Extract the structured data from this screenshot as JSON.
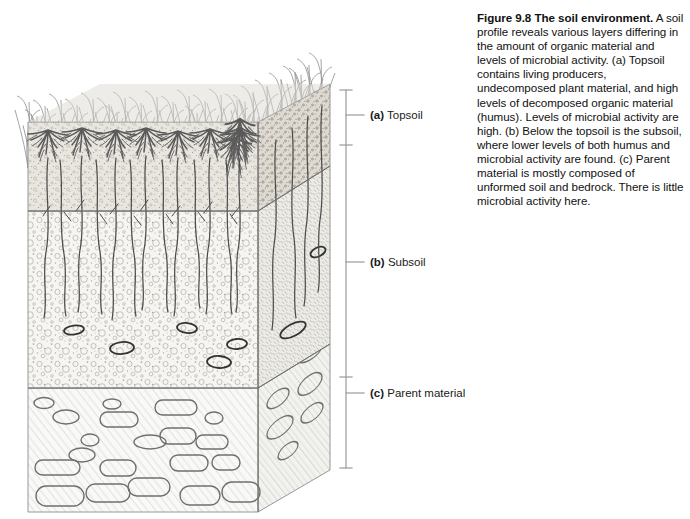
{
  "figure": {
    "number_label": "Figure 9.8",
    "title": "The soil environment.",
    "body": "A soil profile reveals various layers differing in the amount of organic material and levels of microbial activity. (a) Topsoil contains living producers, undecomposed plant material, and high levels of decomposed organic material (humus). Levels of microbial activity are high. (b) Below the topsoil is the subsoil, where lower levels of both humus and microbial activity are found. (c) Parent material is mostly composed of unformed soil and bedrock. There is little microbial activity here."
  },
  "layers": [
    {
      "key": "(a)",
      "name": "Topsoil",
      "id": "topsoil"
    },
    {
      "key": "(b)",
      "name": "Subsoil",
      "id": "subsoil"
    },
    {
      "key": "(c)",
      "name": "Parent material",
      "id": "parent-material"
    }
  ],
  "diagram": {
    "elements": [
      "grass-blades",
      "topsoil-horizon",
      "root-systems",
      "subsoil-horizon",
      "pebbles",
      "parent-material-bedrock"
    ]
  },
  "colors": {
    "ink": "#555555",
    "ink_dark": "#333333",
    "topsoil_fill": "#e8e6e1",
    "subsoil_fill": "#f4f3f0",
    "parent_fill": "#f7f7f5",
    "bracket": "#9a9a9a",
    "text": "#111111"
  }
}
